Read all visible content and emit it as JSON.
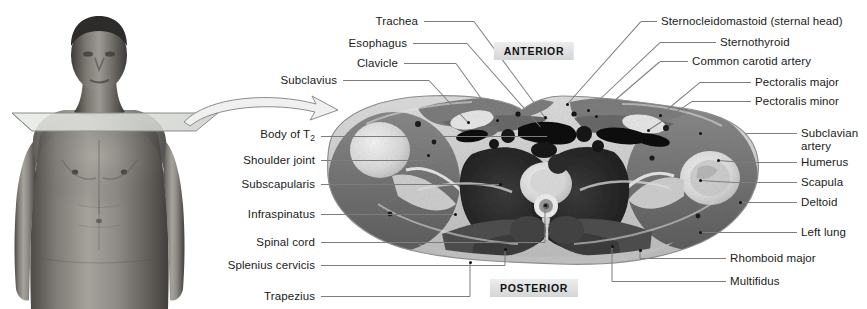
{
  "figure": {
    "orientation": {
      "anterior": "ANTERIOR",
      "posterior": "POSTERIOR"
    },
    "colors": {
      "label_text": "#1a1a1a",
      "leader_line": "#7d7d7d",
      "orientation_box_bg": "#e2e3e4",
      "section_plane": "#d8dad6",
      "background": "#ffffff"
    },
    "photo": {
      "subject": "anterior view of male torso",
      "plane_indicator": "transverse sectional plane across the shoulders",
      "arrow": "curved-arrow-to-section"
    }
  },
  "labels_top_left": [
    {
      "text": "Trachea",
      "y": 21,
      "tx": 418,
      "lx1": 424,
      "lx2": 474,
      "px": 545,
      "py": 117
    },
    {
      "text": "Esophagus",
      "y": 43,
      "tx": 407,
      "lx1": 413,
      "lx2": 467,
      "px": 541,
      "py": 127
    },
    {
      "text": "Clavicle",
      "y": 63,
      "tx": 398,
      "lx1": 404,
      "lx2": 456,
      "px": 497,
      "py": 120
    },
    {
      "text": "Subclavius",
      "y": 80,
      "tx": 337,
      "lx1": 343,
      "lx2": 429,
      "px": 468,
      "py": 122
    }
  ],
  "labels_top_right": [
    {
      "text": "Sternocleidomastoid (sternal head)",
      "y": 21,
      "tx": 661,
      "lx1": 641,
      "lx2": 657,
      "px": 567,
      "py": 104
    },
    {
      "text": "Sternothyroid",
      "y": 42,
      "tx": 720,
      "lx1": 660,
      "lx2": 716,
      "px": 588,
      "py": 110
    },
    {
      "text": "Common carotid artery",
      "y": 61,
      "tx": 692,
      "lx1": 660,
      "lx2": 688,
      "px": 596,
      "py": 116
    },
    {
      "text": "Pectoralis major",
      "y": 82,
      "tx": 755,
      "lx1": 700,
      "lx2": 751,
      "px": 660,
      "py": 115
    },
    {
      "text": "Pectoralis minor",
      "y": 101,
      "tx": 755,
      "lx1": 692,
      "lx2": 751,
      "px": 648,
      "py": 130
    }
  ],
  "labels_left": [
    {
      "text": "Body of T",
      "sub": "2",
      "y": 136,
      "tx": 315,
      "lx1": 321,
      "lx2": 548,
      "px": 548,
      "py": 136
    },
    {
      "text": "Shoulder joint",
      "sub": "",
      "y": 160,
      "tx": 315,
      "lx1": 321,
      "lx2": 428,
      "px": 428,
      "py": 155
    },
    {
      "text": "Subscapularis",
      "sub": "",
      "y": 184,
      "tx": 315,
      "lx1": 321,
      "lx2": 500,
      "px": 500,
      "py": 184
    },
    {
      "text": "Infraspinatus",
      "sub": "",
      "y": 214,
      "tx": 315,
      "lx1": 321,
      "lx2": 455,
      "px": 455,
      "py": 214
    },
    {
      "text": "Spinal cord",
      "sub": "",
      "y": 242,
      "tx": 315,
      "lx1": 321,
      "lx2": 545,
      "px": 545,
      "py": 205
    },
    {
      "text": "Splenius cervicis",
      "sub": "",
      "y": 265,
      "tx": 315,
      "lx1": 321,
      "lx2": 505,
      "px": 505,
      "py": 249
    },
    {
      "text": "Trapezius",
      "sub": "",
      "y": 296,
      "tx": 315,
      "lx1": 321,
      "lx2": 470,
      "px": 470,
      "py": 262
    }
  ],
  "labels_right": [
    {
      "text": "Subclavian",
      "text2": "artery",
      "y": 133,
      "tx": 801,
      "lx1": 745,
      "lx2": 797,
      "px": 700,
      "py": 133
    },
    {
      "text": "Humerus",
      "text2": "",
      "y": 162,
      "tx": 801,
      "lx1": 745,
      "lx2": 797,
      "px": 718,
      "py": 160
    },
    {
      "text": "Scapula",
      "text2": "",
      "y": 182,
      "tx": 801,
      "lx1": 735,
      "lx2": 797,
      "px": 700,
      "py": 180
    },
    {
      "text": "Deltoid",
      "text2": "",
      "y": 202,
      "tx": 801,
      "lx1": 740,
      "lx2": 797,
      "px": 740,
      "py": 202
    },
    {
      "text": "Left lung",
      "text2": "",
      "y": 232,
      "tx": 801,
      "lx1": 700,
      "lx2": 797,
      "px": 700,
      "py": 232
    },
    {
      "text": "Rhomboid major",
      "text2": "",
      "y": 258,
      "tx": 730,
      "lx1": 640,
      "lx2": 726,
      "px": 640,
      "py": 250
    },
    {
      "text": "Multifidus",
      "text2": "",
      "y": 281,
      "tx": 730,
      "lx1": 612,
      "lx2": 726,
      "px": 612,
      "py": 246
    }
  ]
}
